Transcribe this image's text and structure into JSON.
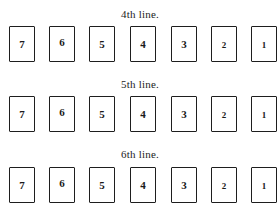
{
  "rows": [
    {
      "label": "4th line.",
      "cards": [
        "7",
        "6",
        "5",
        "4",
        "3",
        "2",
        "1"
      ]
    },
    {
      "label": "5th line.",
      "cards": [
        "7",
        "6",
        "5",
        "4",
        "3",
        "2",
        "1"
      ]
    },
    {
      "label": "6th line.",
      "cards": [
        "7",
        "6",
        "5",
        "4",
        "3",
        "2",
        "1"
      ]
    }
  ],
  "colors": {
    "background": "#ffffff",
    "ink": "#1a1a1a"
  }
}
